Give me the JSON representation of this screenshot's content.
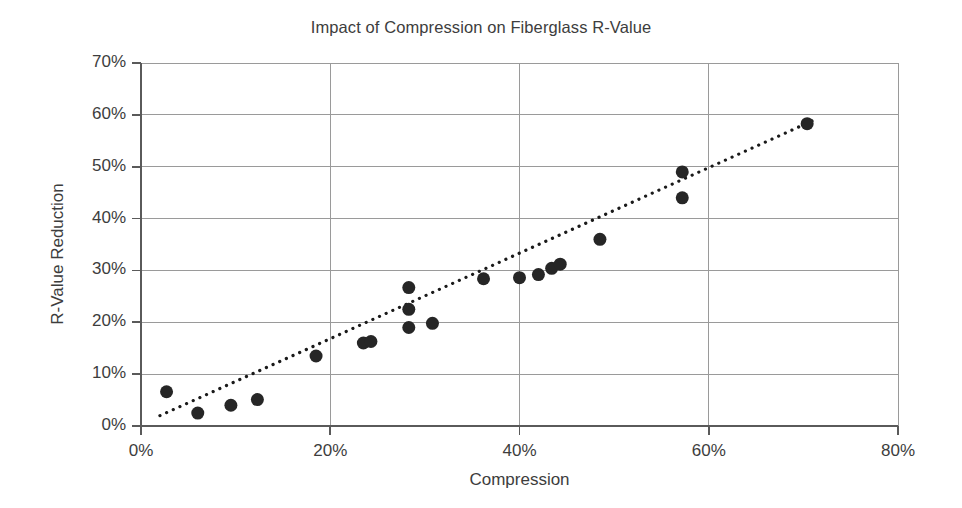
{
  "chart_data": {
    "type": "scatter",
    "title": "Impact of Compression on Fiberglass R-Value",
    "xlabel": "Compression",
    "ylabel": "R-Value Reduction",
    "xlim": [
      0,
      80
    ],
    "ylim": [
      0,
      70
    ],
    "xticks": [
      0,
      20,
      40,
      60,
      80
    ],
    "xtick_labels": [
      "0%",
      "20%",
      "40%",
      "60%",
      "80%"
    ],
    "yticks": [
      0,
      10,
      20,
      30,
      40,
      50,
      60,
      70
    ],
    "ytick_labels": [
      "0%",
      "10%",
      "20%",
      "30%",
      "40%",
      "50%",
      "60%",
      "70%"
    ],
    "grid": true,
    "grid_axis": "both",
    "legend": false,
    "marker": "circle",
    "marker_color": "#262626",
    "marker_size": 13,
    "trendline": {
      "style": "dotted",
      "color": "#1a1a1a",
      "width": 3.2,
      "x_start": 2.0,
      "y_start": 2.0,
      "x_end": 71.5,
      "y_end": 59.3
    },
    "series": [
      {
        "name": "Fiberglass batt samples",
        "points": [
          {
            "x": 2.7,
            "y": 6.6
          },
          {
            "x": 6.0,
            "y": 2.5
          },
          {
            "x": 9.5,
            "y": 4.0
          },
          {
            "x": 12.3,
            "y": 5.1
          },
          {
            "x": 18.5,
            "y": 13.5
          },
          {
            "x": 23.5,
            "y": 16.0
          },
          {
            "x": 24.3,
            "y": 16.3
          },
          {
            "x": 28.3,
            "y": 26.7
          },
          {
            "x": 28.3,
            "y": 22.5
          },
          {
            "x": 28.3,
            "y": 19.0
          },
          {
            "x": 30.8,
            "y": 19.8
          },
          {
            "x": 36.2,
            "y": 28.4
          },
          {
            "x": 40.0,
            "y": 28.6
          },
          {
            "x": 42.0,
            "y": 29.2
          },
          {
            "x": 43.4,
            "y": 30.4
          },
          {
            "x": 44.3,
            "y": 31.2
          },
          {
            "x": 48.5,
            "y": 36.0
          },
          {
            "x": 57.2,
            "y": 49.0
          },
          {
            "x": 57.2,
            "y": 44.0
          },
          {
            "x": 70.4,
            "y": 58.3
          }
        ]
      }
    ]
  },
  "colors": {
    "axis": "#5a5a5a",
    "grid": "#9a9a9a",
    "marker": "#262626",
    "text": "#3d3d3d",
    "background": "#ffffff"
  }
}
